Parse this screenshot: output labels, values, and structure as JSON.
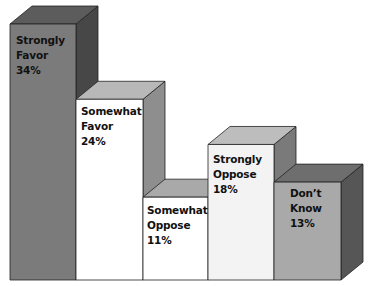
{
  "chart_data": {
    "type": "bar",
    "style": "3d",
    "title": "",
    "xlabel": "",
    "ylabel": "",
    "categories": [
      "Strongly Favor",
      "Somewhat Favor",
      "Somewhat Oppose",
      "Strongly Oppose",
      "Don't Know"
    ],
    "values": [
      34,
      24,
      11,
      18,
      13
    ],
    "unit": "%",
    "ylim": [
      0,
      34
    ],
    "grid": false,
    "legend": "none",
    "annotations": [
      {
        "category": "Strongly Favor",
        "label_lines": [
          "Strongly",
          "Favor",
          "34%"
        ]
      },
      {
        "category": "Somewhat Favor",
        "label_lines": [
          "Somewhat",
          "Favor",
          "24%"
        ]
      },
      {
        "category": "Somewhat Oppose",
        "label_lines": [
          "Somewhat",
          "Oppose",
          "11%"
        ]
      },
      {
        "category": "Strongly Oppose",
        "label_lines": [
          "Strongly",
          "Oppose",
          "18%"
        ]
      },
      {
        "category": "Don't Know",
        "label_lines": [
          "Don’t",
          "Know",
          "13%"
        ]
      }
    ]
  },
  "bars": [
    {
      "label": "Strongly\nFavor\n34%",
      "front": "#7b7b7b",
      "top": "#5c5c5c",
      "side": "#474747"
    },
    {
      "label": "Somewhat\nFavor\n24%",
      "front": "#ffffff",
      "top": "#b8b8b8",
      "side": "#8e8e8e"
    },
    {
      "label": "Somewhat\nOppose\n11%",
      "front": "#ffffff",
      "top": "#a9a9a9",
      "side": "#8e8e8e"
    },
    {
      "label": "Strongly\nOppose\n18%",
      "front": "#f3f3f3",
      "top": "#bdbdbd",
      "side": "#7a7a7a"
    },
    {
      "label": "Don’t\nKnow\n13%",
      "front": "#a9a9a9",
      "top": "#6e6e6e",
      "side": "#565656"
    }
  ]
}
